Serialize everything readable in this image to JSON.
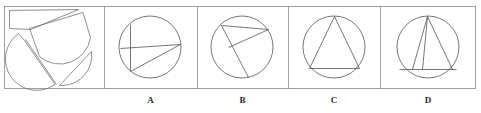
{
  "figure": {
    "type": "visual-reasoning-multiple-choice",
    "canvas": {
      "width": 481,
      "height": 113
    },
    "style": {
      "background": "#ffffff",
      "stroke": "#5a5a5a",
      "stroke_dark": "#3a3a3a",
      "frame_stroke": "#8a8a8a",
      "stroke_width": 0.7,
      "label_color": "#2b2b2b"
    },
    "frame": {
      "x": 4,
      "y": 6,
      "width": 472,
      "height": 83
    },
    "dividers_x": [
      104,
      197,
      288,
      380
    ],
    "panels": [
      {
        "id": "stimulus",
        "name": "dissected-circle-stimulus",
        "label": "",
        "box": {
          "x": 4,
          "y": 6,
          "width": 100,
          "height": 83
        },
        "description": "Circle cut into four pieces shown separated and rotated",
        "circle": {
          "cx": 48,
          "cy": 55,
          "r": 28
        },
        "pieces": [
          "thin-sliver-top-left",
          "large-semicircular-arc-piece-rotated",
          "main-circle-body-with-chord",
          "small-wedge-bottom-right"
        ]
      },
      {
        "id": "A",
        "name": "option-a",
        "label": "A",
        "box": {
          "x": 104,
          "y": 6,
          "width": 93,
          "height": 83
        },
        "circle": {
          "cx": 150,
          "cy": 47,
          "r": 31
        },
        "description": "Circle with horizontal chord across, short vertical chord on left, and a diagonal chord from lower-left to right",
        "lines": [
          "horizontal chord left-edge to right-edge",
          "vertical segment upper-left down to horizontal chord",
          "diagonal from bottom-left of vertical to right end of horizontal"
        ]
      },
      {
        "id": "B",
        "name": "option-b",
        "label": "B",
        "box": {
          "x": 197,
          "y": 6,
          "width": 91,
          "height": 83
        },
        "circle": {
          "cx": 242,
          "cy": 47,
          "r": 31
        },
        "description": "Circle with near-horizontal chord near top, a short chord angling down-left, and a long chord running to the bottom of the circle",
        "lines": [
          "upper chord from upper-left to upper-right",
          "short chord from upper-right down-left to mid-left point",
          "long chord from upper-left down to bottom"
        ]
      },
      {
        "id": "C",
        "name": "option-c",
        "label": "C",
        "box": {
          "x": 288,
          "y": 6,
          "width": 92,
          "height": 83
        },
        "circle": {
          "cx": 334,
          "cy": 47,
          "r": 31
        },
        "description": "Circle with an inscribed triangle, apex at top, horizontal base near the bottom",
        "lines": [
          "horizontal base chord",
          "left side from apex to base-left",
          "right side from apex to base-right"
        ]
      },
      {
        "id": "D",
        "name": "option-d",
        "label": "D",
        "box": {
          "x": 380,
          "y": 6,
          "width": 96,
          "height": 83
        },
        "circle": {
          "cx": 428,
          "cy": 47,
          "r": 31
        },
        "description": "Circle with a horizontal chord near the bottom and three lines radiating from the top apex down to the chord, forming a triangle split by an extra interior line",
        "lines": [
          "horizontal base chord",
          "left line from apex to base",
          "middle interior line from apex to base",
          "right line from apex to base-right"
        ]
      }
    ]
  }
}
